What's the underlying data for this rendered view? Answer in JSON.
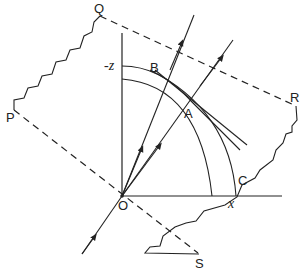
{
  "figure": {
    "type": "ray-refraction-geometry-diagram",
    "background": "#ffffff",
    "stroke_color": "#222222",
    "labels": {
      "Q": "Q",
      "P": "P",
      "R": "R",
      "S": "S",
      "O": "O",
      "A": "A",
      "B": "B",
      "C": "C",
      "neg_z": "-z",
      "x": "x"
    },
    "elements": {
      "boundary_dashed_top": "Q–R dashed line",
      "boundary_dashed_bottom": "P–S dashed line through O",
      "wavy_edge_left": "P–Q irregular edge",
      "wavy_edge_right": "R–S irregular edge",
      "axes": [
        "vertical -z axis from O",
        "horizontal x axis from O"
      ],
      "arcs": [
        "inner circular arc",
        "curve through B and A",
        "outer arc through C"
      ],
      "tangent_line": "tangent at A",
      "rays": [
        "incident ray into O",
        "ray O to B (arrow)",
        "ray O through A (arrow)"
      ]
    }
  }
}
